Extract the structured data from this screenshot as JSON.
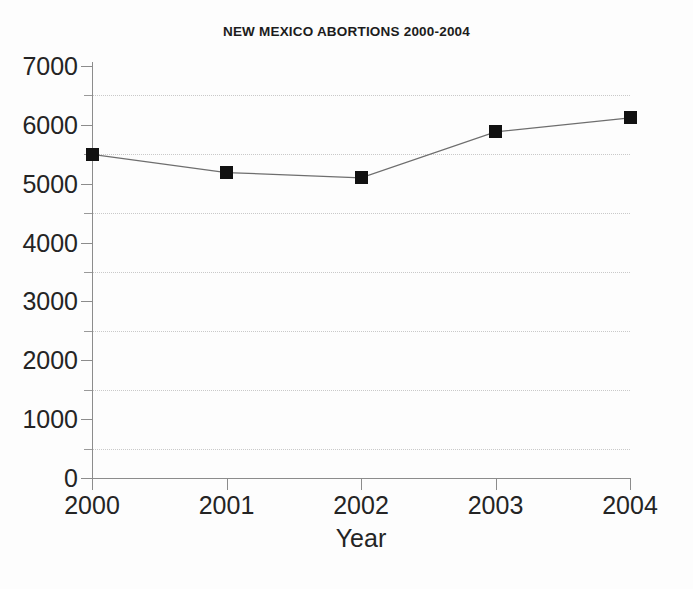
{
  "chart_data": {
    "type": "line",
    "title": "NEW MEXICO ABORTIONS 2000-2004",
    "xlabel": "Year",
    "ylabel": "",
    "categories": [
      "2000",
      "2001",
      "2002",
      "2003",
      "2004"
    ],
    "x": [
      2000,
      2001,
      2002,
      2003,
      2004
    ],
    "values": [
      5500,
      5190,
      5100,
      5880,
      6120
    ],
    "series": [
      {
        "name": "New Mexico abortions",
        "values": [
          5500,
          5190,
          5100,
          5880,
          6120
        ]
      }
    ],
    "ylim": [
      0,
      7000
    ],
    "xlim": [
      2000,
      2004
    ],
    "y_major_ticks": [
      0,
      1000,
      2000,
      3000,
      4000,
      5000,
      6000,
      7000
    ],
    "y_minor_ticks": [
      500,
      1500,
      2500,
      3500,
      4500,
      5500,
      6500
    ],
    "y_tick_labels": [
      "0",
      "1000",
      "2000",
      "3000",
      "4000",
      "5000",
      "6000",
      "7000"
    ],
    "x_tick_labels": [
      "2000",
      "2001",
      "2002",
      "2003",
      "2004"
    ],
    "gridlines": {
      "horizontal": [
        500,
        1500,
        2500,
        3500,
        4500,
        5500,
        6500
      ],
      "vertical": [],
      "style": "dotted",
      "color": "#c9c9c9"
    },
    "legend": {
      "visible": false,
      "position": "none",
      "entries": []
    },
    "marker": {
      "shape": "square",
      "color": "#111111",
      "size": 13
    },
    "line": {
      "color": "#6e6e6e",
      "width": 1.2
    },
    "annotations": []
  },
  "colors": {
    "background": "#fdfdfd",
    "axis": "#8c8c8c",
    "text": "#242424",
    "title": "#1c1c1c",
    "grid": "#c9c9c9",
    "marker": "#111111",
    "line": "#6e6e6e"
  }
}
